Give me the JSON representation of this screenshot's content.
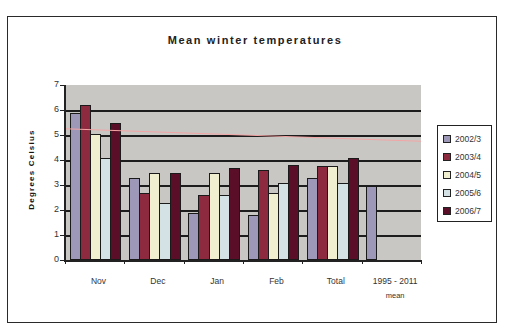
{
  "chart_data": {
    "type": "bar",
    "title": "Mean winter temperatures",
    "xlabel": "",
    "ylabel": "Degrees Celsius",
    "ylim": [
      0,
      7
    ],
    "yticks": [
      0,
      1,
      2,
      3,
      4,
      5,
      6,
      7
    ],
    "grid": true,
    "legend_position": "right",
    "categories": [
      "Nov",
      "Dec",
      "Jan",
      "Feb",
      "Total",
      "1995 - 2011 mean"
    ],
    "series": [
      {
        "name": "2002/3",
        "color": "#9d97b8",
        "values": [
          5.9,
          3.3,
          1.9,
          1.8,
          3.3,
          2.95
        ]
      },
      {
        "name": "2003/4",
        "color": "#8e2a40",
        "values": [
          6.2,
          2.7,
          2.6,
          3.6,
          3.75,
          null
        ]
      },
      {
        "name": "2004/5",
        "color": "#f0efcf",
        "values": [
          5.05,
          3.5,
          3.5,
          2.7,
          3.75,
          null
        ]
      },
      {
        "name": "2005/6",
        "color": "#d4e2e6",
        "values": [
          4.1,
          2.3,
          2.6,
          3.1,
          3.1,
          null
        ]
      },
      {
        "name": "2006/7",
        "color": "#5a0e28",
        "values": [
          5.5,
          3.5,
          3.7,
          3.8,
          4.1,
          null
        ]
      }
    ],
    "annotations": [
      {
        "type": "line",
        "color": "#f2a5a5",
        "from_value": 5.25,
        "to_value": 4.75,
        "description": "faint pink sloped reference line across plot"
      }
    ],
    "plot_background": "#c9c7c4"
  },
  "labels": {
    "title": "Mean winter temperatures",
    "ylabel": "Degrees Celsius",
    "categories": [
      "Nov",
      "Dec",
      "Jan",
      "Feb",
      "Total",
      "1995 - 2011"
    ],
    "last_category_line2": "mean",
    "yticks": [
      "0",
      "1",
      "2",
      "3",
      "4",
      "5",
      "6",
      "7"
    ],
    "legend": [
      "2002/3",
      "2003/4",
      "2004/5",
      "2005/6",
      "2006/7"
    ]
  }
}
